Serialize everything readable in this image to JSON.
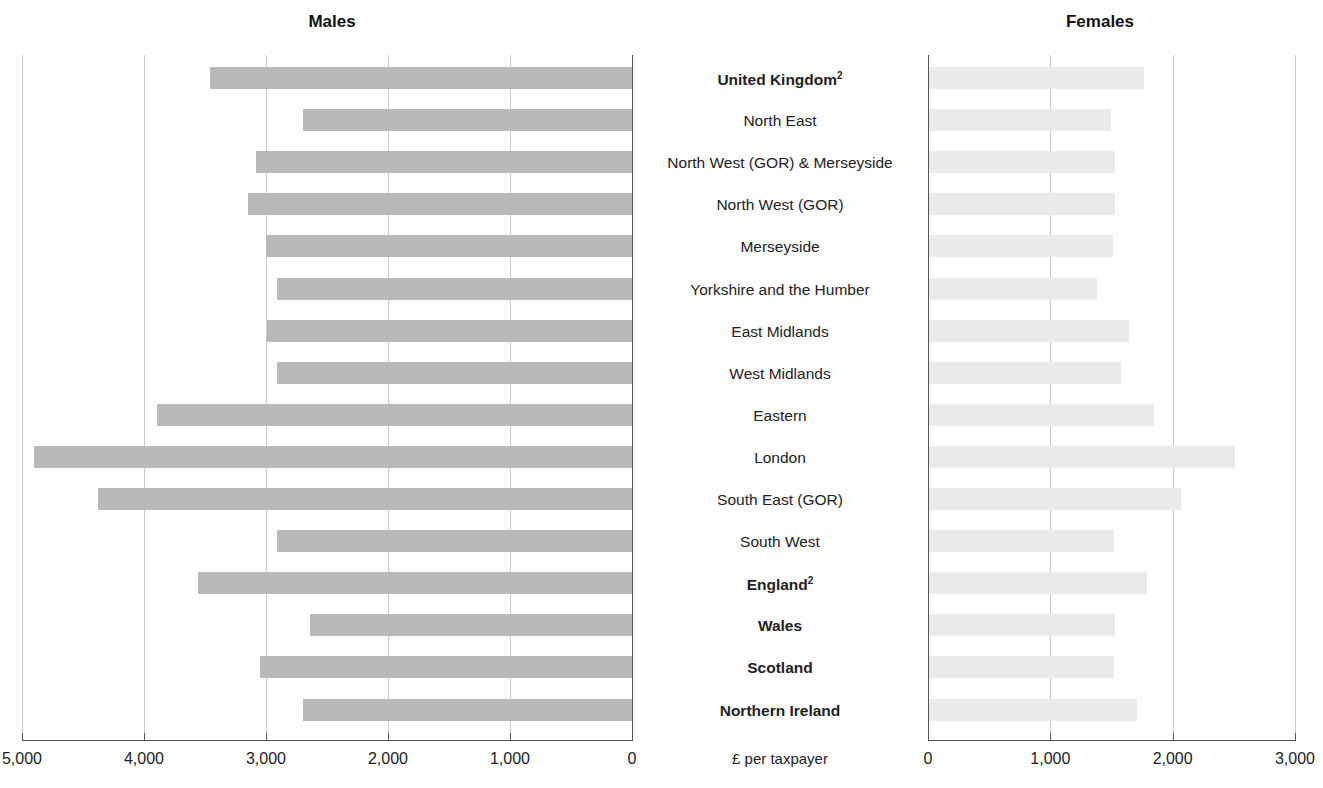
{
  "panels": {
    "left_title": "Males",
    "right_title": "Females",
    "unit_label": "£ per taxpayer"
  },
  "axes": {
    "left_ticks": [
      "5,000",
      "4,000",
      "3,000",
      "2,000",
      "1,000",
      "0"
    ],
    "right_ticks": [
      "0",
      "1,000",
      "2,000",
      "3,000"
    ],
    "left_range": [
      5000,
      0
    ],
    "right_range": [
      0,
      3000
    ]
  },
  "chart_data": {
    "type": "bar",
    "title": "",
    "subtitle": "",
    "orientation": "horizontal",
    "layout": "bidirectional population pyramid (back-to-back bars)",
    "xlabel": "£ per taxpayer",
    "ylabel": "",
    "grid": true,
    "legend": "none",
    "left_axis": {
      "name": "Males",
      "ticks": [
        5000,
        4000,
        3000,
        2000,
        1000,
        0
      ],
      "xlim": [
        5000,
        0
      ],
      "direction": "right-to-left (zero on right)"
    },
    "right_axis": {
      "name": "Females",
      "ticks": [
        0,
        1000,
        2000,
        3000
      ],
      "xlim": [
        0,
        3000
      ],
      "direction": "left-to-right (zero on left)"
    },
    "categories": [
      "United Kingdom²",
      "North East",
      "North West (GOR) & Merseyside",
      "North West (GOR)",
      "Merseyside",
      "Yorkshire and the Humber",
      "East Midlands",
      "West Midlands",
      "Eastern",
      "London",
      "South East (GOR)",
      "South West",
      "England²",
      "Wales",
      "Scotland",
      "Northern Ireland"
    ],
    "category_emphasis": [
      true,
      false,
      false,
      false,
      false,
      false,
      false,
      false,
      false,
      false,
      false,
      false,
      true,
      true,
      true,
      true
    ],
    "series": [
      {
        "name": "Males",
        "color": "#b9b9b9",
        "values": [
          3460,
          2700,
          3080,
          3150,
          3000,
          2910,
          2990,
          2910,
          3890,
          4900,
          4380,
          2910,
          3560,
          2640,
          3050,
          2700
        ]
      },
      {
        "name": "Females",
        "color": "#eaeaea",
        "values": [
          1760,
          1490,
          1520,
          1520,
          1505,
          1375,
          1635,
          1570,
          1840,
          2500,
          2060,
          1510,
          1780,
          1520,
          1510,
          1700
        ]
      }
    ]
  },
  "rows": [
    {
      "label": "United Kingdom",
      "sup": "2",
      "bold": true,
      "male": 3460,
      "female": 1760
    },
    {
      "label": "North East",
      "sup": "",
      "bold": false,
      "male": 2700,
      "female": 1490
    },
    {
      "label": "North West (GOR) & Merseyside",
      "sup": "",
      "bold": false,
      "male": 3080,
      "female": 1520
    },
    {
      "label": "North West (GOR)",
      "sup": "",
      "bold": false,
      "male": 3150,
      "female": 1520
    },
    {
      "label": "Merseyside",
      "sup": "",
      "bold": false,
      "male": 3000,
      "female": 1505
    },
    {
      "label": "Yorkshire and the Humber",
      "sup": "",
      "bold": false,
      "male": 2910,
      "female": 1375
    },
    {
      "label": "East Midlands",
      "sup": "",
      "bold": false,
      "male": 2990,
      "female": 1635
    },
    {
      "label": "West Midlands",
      "sup": "",
      "bold": false,
      "male": 2910,
      "female": 1570
    },
    {
      "label": "Eastern",
      "sup": "",
      "bold": false,
      "male": 3890,
      "female": 1840
    },
    {
      "label": "London",
      "sup": "",
      "bold": false,
      "male": 4900,
      "female": 2500
    },
    {
      "label": "South East (GOR)",
      "sup": "",
      "bold": false,
      "male": 4380,
      "female": 2060
    },
    {
      "label": "South West",
      "sup": "",
      "bold": false,
      "male": 2910,
      "female": 1510
    },
    {
      "label": "England",
      "sup": "2",
      "bold": true,
      "male": 3560,
      "female": 1780
    },
    {
      "label": "Wales",
      "sup": "",
      "bold": true,
      "male": 2640,
      "female": 1520
    },
    {
      "label": "Scotland",
      "sup": "",
      "bold": true,
      "male": 3050,
      "female": 1510
    },
    {
      "label": "Northern Ireland",
      "sup": "",
      "bold": true,
      "male": 2700,
      "female": 1700
    }
  ],
  "colors": {
    "male_bar": "#b9b9b9",
    "female_bar": "#eaeaea",
    "gridline": "#c9c9c9",
    "axis": "#555555",
    "text": "#1a1a1a"
  }
}
